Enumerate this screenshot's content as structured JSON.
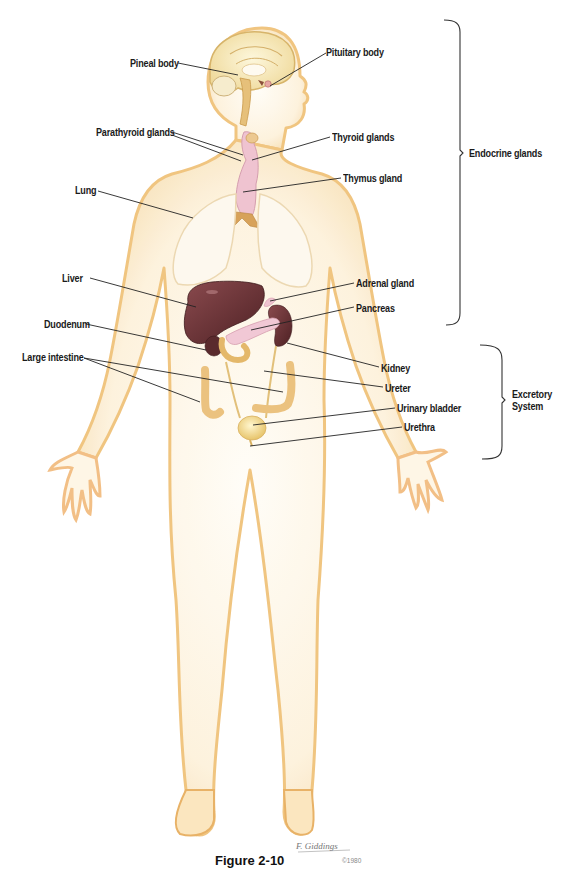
{
  "figure": {
    "caption": "Figure 2-10",
    "signature": "F. Giddings",
    "copyright": "©1980"
  },
  "groups": {
    "endocrine": {
      "label": "Endocrine glands",
      "bracket_top": 20,
      "bracket_bottom": 325,
      "x": 460
    },
    "excretory": {
      "label_line1": "Excretory",
      "label_line2": "System",
      "bracket_top": 345,
      "bracket_bottom": 458,
      "x": 506
    }
  },
  "labels": {
    "pineal_body": {
      "text": "Pineal body",
      "x": 130,
      "y": 57
    },
    "pituitary_body": {
      "text": "Pituitary body",
      "x": 326,
      "y": 46
    },
    "parathyroid_glands": {
      "text": "Parathyroid glands",
      "x": 96,
      "y": 126
    },
    "thyroid_glands": {
      "text": "Thyroid glands",
      "x": 332,
      "y": 131
    },
    "thymus_gland": {
      "text": "Thymus gland",
      "x": 343,
      "y": 172
    },
    "lung": {
      "text": "Lung",
      "x": 75,
      "y": 184
    },
    "liver": {
      "text": "Liver",
      "x": 62,
      "y": 272
    },
    "adrenal_gland": {
      "text": "Adrenal gland",
      "x": 356,
      "y": 277
    },
    "pancreas": {
      "text": "Pancreas",
      "x": 356,
      "y": 302
    },
    "duodenum": {
      "text": "Duodenum",
      "x": 44,
      "y": 318
    },
    "large_intestine": {
      "text": "Large intestine",
      "x": 22,
      "y": 351
    },
    "kidney": {
      "text": "Kidney",
      "x": 381,
      "y": 362
    },
    "ureter": {
      "text": "Ureter",
      "x": 385,
      "y": 382
    },
    "urinary_bladder": {
      "text": "Urinary bladder",
      "x": 397,
      "y": 402
    },
    "urethra": {
      "text": "Urethra",
      "x": 404,
      "y": 421
    }
  },
  "colors": {
    "skin_outline": "#f0c27a",
    "skin_fill": "#fdf3df",
    "organ_dark": "#6e3438",
    "organ_pink": "#efc3d0",
    "bone_tan": "#d7a25a",
    "bladder": "#f3dc8e",
    "intestine": "#e9c37c",
    "text": "#1a1a1a",
    "leader": "#222222"
  }
}
